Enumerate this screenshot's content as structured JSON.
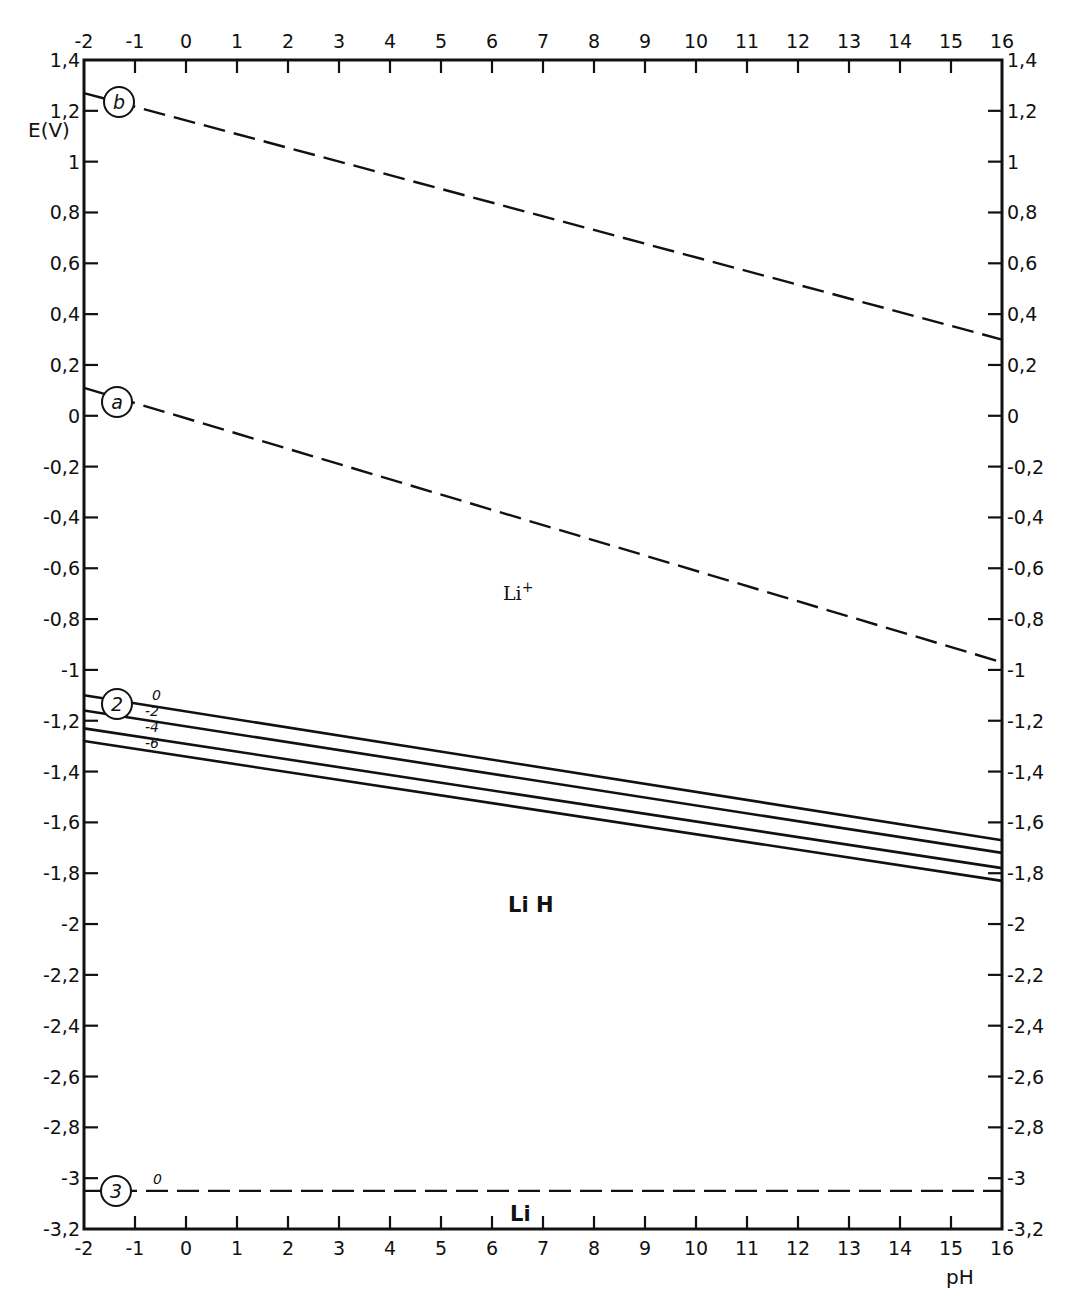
{
  "chart_data": {
    "type": "line",
    "title": "",
    "xlabel": "pH",
    "ylabel": "E(V)",
    "xlim": [
      -2,
      16
    ],
    "ylim": [
      -3.2,
      1.4
    ],
    "grid": false,
    "x_ticks": [
      -2,
      -1,
      0,
      1,
      2,
      3,
      4,
      5,
      6,
      7,
      8,
      9,
      10,
      11,
      12,
      13,
      14,
      15,
      16
    ],
    "x_tick_labels": [
      "-2",
      "-1",
      "0",
      "1",
      "2",
      "3",
      "4",
      "5",
      "6",
      "7",
      "8",
      "9",
      "10",
      "11",
      "12",
      "13",
      "14",
      "15",
      "16"
    ],
    "y_ticks": [
      1.4,
      1.2,
      1,
      0.8,
      0.6,
      0.4,
      0.2,
      0,
      -0.2,
      -0.4,
      -0.6,
      -0.8,
      -1,
      -1.2,
      -1.4,
      -1.6,
      -1.8,
      -2,
      -2.2,
      -2.4,
      -2.6,
      -2.8,
      -3,
      -3.2
    ],
    "y_tick_labels": [
      "1,4",
      "1,2",
      "1",
      "0,8",
      "0,6",
      "0,4",
      "0,2",
      "0",
      "-0,2",
      "-0,4",
      "-0,6",
      "-0,8",
      "-1",
      "-1,2",
      "-1,4",
      "-1,6",
      "-1,8",
      "-2",
      "-2,2",
      "-2,4",
      "-2,6",
      "-2,8",
      "-3",
      "-3,2"
    ],
    "series": [
      {
        "name": "b",
        "style": "dashed",
        "x": [
          -2,
          16
        ],
        "y": [
          1.27,
          0.3
        ]
      },
      {
        "name": "a",
        "style": "dashed",
        "x": [
          -2,
          16
        ],
        "y": [
          0.11,
          -0.97
        ]
      },
      {
        "name": "2 (0)",
        "style": "solid",
        "x": [
          -2,
          16
        ],
        "y": [
          -1.1,
          -1.67
        ]
      },
      {
        "name": "2 (-2)",
        "style": "solid",
        "x": [
          -2,
          16
        ],
        "y": [
          -1.16,
          -1.72
        ]
      },
      {
        "name": "2 (-4)",
        "style": "solid",
        "x": [
          -2,
          16
        ],
        "y": [
          -1.23,
          -1.78
        ]
      },
      {
        "name": "2 (-6)",
        "style": "solid",
        "x": [
          -2,
          16
        ],
        "y": [
          -1.28,
          -1.83
        ]
      },
      {
        "name": "3 (0)",
        "style": "dashed",
        "x": [
          -2,
          16
        ],
        "y": [
          -3.05,
          -3.05
        ]
      }
    ],
    "annotations": [
      {
        "text": "b",
        "type": "circled",
        "x": -1.3,
        "y": 1.23
      },
      {
        "text": "a",
        "type": "circled",
        "x": -1.3,
        "y": 0.06
      },
      {
        "text": "2",
        "type": "circled",
        "x": -1.3,
        "y": -1.13
      },
      {
        "text": "3",
        "type": "circled",
        "x": -1.3,
        "y": -3.05
      },
      {
        "text": "0",
        "x": -0.55,
        "y": -1.1
      },
      {
        "text": "-2",
        "x": -0.55,
        "y": -1.17
      },
      {
        "text": "-4",
        "x": -0.55,
        "y": -1.23
      },
      {
        "text": "-6",
        "x": -0.55,
        "y": -1.29
      },
      {
        "text": "0",
        "x": -0.55,
        "y": -3.01
      },
      {
        "text": "Li⁺",
        "x": 7.2,
        "y": -0.68,
        "kind": "region"
      },
      {
        "text": "Li H",
        "x": 7.2,
        "y": -1.93,
        "kind": "region"
      },
      {
        "text": "Li",
        "x": 7.2,
        "y": -3.14,
        "kind": "region"
      }
    ]
  },
  "labels": {
    "ylabel": "E(V)",
    "xlabel": "pH",
    "region_li_plus": "Li",
    "region_li_plus_sup": "+",
    "region_lih": "Li H",
    "region_li": "Li",
    "circle_b": "b",
    "circle_a": "a",
    "circle_2": "2",
    "circle_3": "3",
    "line2_labels": [
      "0",
      "-2",
      "-4",
      "-6"
    ],
    "line3_label": "0"
  }
}
